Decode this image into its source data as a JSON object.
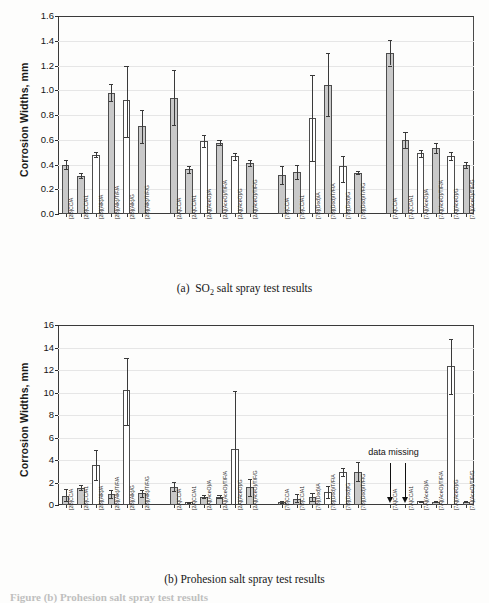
{
  "figure": {
    "caption_partial": "Figure  (b)  Prohesion salt spray test results",
    "ylabel": "Corrosion Widths, mm"
  },
  "panel_a": {
    "caption_prefix": "(a)",
    "caption_main_1": "SO",
    "caption_sub": "2",
    "caption_main_2": "salt spray test results"
  },
  "panel_b": {
    "caption": "(b) Prohesion salt spray test results",
    "annotation": "data missing"
  },
  "chart_data": [
    {
      "type": "bar",
      "title": "(a) SO2 salt spray test results",
      "xlabel": "",
      "ylabel": "Corrosion Widths, mm",
      "ylim": [
        0.0,
        1.6
      ],
      "yticks": [
        "0.0",
        "0.2",
        "0.4",
        "0.6",
        "0.8",
        "1.0",
        "1.2",
        "1.4",
        "1.6"
      ],
      "grid": false,
      "error_bars": true,
      "groups": [
        {
          "name": "2B",
          "categories": [
            "[2B]CC/A",
            "[2B]CC/A1",
            "[2B](Alk)/A",
            "[2B](Alk)/T/F/A",
            "[2B](Alk)/G",
            "[2B](Alk)/T/F/G"
          ],
          "values": [
            0.4,
            0.31,
            0.48,
            0.98,
            0.92,
            0.71
          ],
          "err_low": [
            0.035,
            0.02,
            0.02,
            0.07,
            0.3,
            0.14
          ],
          "err_high": [
            0.035,
            0.02,
            0.025,
            0.07,
            0.28,
            0.13
          ],
          "fill": [
            "gray",
            "gray",
            "white",
            "gray",
            "white",
            "gray"
          ]
        },
        {
          "name": "2A",
          "categories": [
            "[2A]CC/A",
            "[2A]CC/A1",
            "[2A](AceO)/A",
            "[2A](AceO)/T/F/A",
            "[2A](AceO)/G",
            "[2A](AceO)/T/F/G"
          ],
          "values": [
            0.94,
            0.36,
            0.59,
            0.575,
            0.465,
            0.415
          ],
          "err_low": [
            0.22,
            0.025,
            0.045,
            0.02,
            0.03,
            0.025
          ],
          "err_high": [
            0.22,
            0.025,
            0.045,
            0.02,
            0.03,
            0.025
          ],
          "fill": [
            "gray",
            "gray",
            "white",
            "gray",
            "white",
            "gray"
          ]
        },
        {
          "name": "7B",
          "categories": [
            "[7B]CC/A",
            "[7B]CC/A1",
            "[7B](Dod)/A",
            "[7B](Dod)/T/F/A",
            "[7B](Dod)/G",
            "[7B](Dod)/T/F/G"
          ],
          "values": [
            0.315,
            0.34,
            0.775,
            1.045,
            0.385,
            0.335
          ],
          "err_low": [
            0.075,
            0.055,
            0.345,
            0.255,
            0.125,
            0.015
          ],
          "err_high": [
            0.075,
            0.055,
            0.345,
            0.255,
            0.085,
            0.015
          ],
          "fill": [
            "gray",
            "gray",
            "white",
            "gray",
            "white",
            "gray"
          ]
        },
        {
          "name": "7A",
          "categories": [
            "[7A]CC/A",
            "[7A]CC/A1",
            "[7A](AceO)/A",
            "[7A](AceO)/T/F/A",
            "[7A](AceO)/G",
            "[7A](AceO)/T/F/G"
          ],
          "values": [
            1.305,
            0.6,
            0.49,
            0.535,
            0.47,
            0.395
          ],
          "err_low": [
            0.105,
            0.065,
            0.03,
            0.04,
            0.03,
            0.025
          ],
          "err_high": [
            0.105,
            0.065,
            0.03,
            0.04,
            0.03,
            0.025
          ],
          "fill": [
            "gray",
            "gray",
            "white",
            "gray",
            "white",
            "gray"
          ]
        }
      ]
    },
    {
      "type": "bar",
      "title": "(b) Prohesion salt spray test results",
      "xlabel": "",
      "ylabel": "Corrosion Widths, mm",
      "ylim": [
        0,
        16
      ],
      "yticks": [
        "0",
        "2",
        "4",
        "6",
        "8",
        "10",
        "12",
        "14",
        "16"
      ],
      "grid": false,
      "error_bars": true,
      "annotations": [
        {
          "text": "data missing",
          "targets": [
            "[7A]CC/A",
            "[7A]CC/A1"
          ]
        }
      ],
      "groups": [
        {
          "name": "2B",
          "categories": [
            "[2B]CC/A",
            "[2B]CC/A1",
            "[2B](Alk)/A",
            "[2B](Alk)/T/F/A",
            "[2B](Alk)/G",
            "[2B](Alk)/T/F/G"
          ],
          "values": [
            0.8,
            1.55,
            3.6,
            1.0,
            10.2,
            1.05
          ],
          "err_low": [
            0.45,
            0.2,
            1.35,
            0.35,
            3.05,
            0.35
          ],
          "err_high": [
            0.6,
            0.2,
            1.3,
            0.35,
            2.85,
            0.3
          ],
          "fill": [
            "gray",
            "gray",
            "white",
            "gray",
            "white",
            "gray"
          ]
        },
        {
          "name": "2A",
          "categories": [
            "[2A]CC/A",
            "[2A]CC/A1",
            "[2A](AceO)/A",
            "[2A](AceO)/T/F/A",
            "[2A](AceO)/G",
            "[2A](AceO)/T/F/G"
          ],
          "values": [
            1.6,
            0.25,
            0.75,
            0.7,
            5.0,
            1.6
          ],
          "err_low": [
            0.35,
            0.05,
            0.15,
            0.1,
            4.9,
            0.8
          ],
          "err_high": [
            0.45,
            0.05,
            0.15,
            0.15,
            5.1,
            0.75
          ],
          "fill": [
            "gray",
            "white",
            "gray",
            "gray",
            "white",
            "gray"
          ]
        },
        {
          "name": "7B",
          "categories": [
            "[7B]CC/A",
            "[7B]CC/A1",
            "[7B](Dod)/A",
            "[7B](Dod)/T/F/A",
            "[7B](Dod)/G",
            "[7B](Dod)/T/F/G"
          ],
          "values": [
            0.3,
            0.55,
            0.7,
            1.2,
            2.95,
            2.95
          ],
          "err_low": [
            0.1,
            0.3,
            0.35,
            0.55,
            0.35,
            0.85
          ],
          "err_high": [
            0.1,
            0.4,
            0.4,
            0.5,
            0.35,
            0.85
          ],
          "fill": [
            "gray",
            "gray",
            "gray",
            "white",
            "white",
            "gray"
          ]
        },
        {
          "name": "7A",
          "categories": [
            "[7A]CC/A",
            "[7A]CC/A1",
            "[7A](AceO)/A",
            "[7A](AceO)/T/F/A",
            "[7A](AceO)/G",
            "[7A](AceO)/T/F/G"
          ],
          "values": [
            0.0,
            0.0,
            0.35,
            0.3,
            12.35,
            0.3
          ],
          "err_low": [
            0,
            0,
            0.05,
            0.05,
            2.45,
            0.05
          ],
          "err_high": [
            0,
            0,
            0.05,
            0.05,
            2.45,
            0.05
          ],
          "fill": [
            "white",
            "white",
            "white",
            "gray",
            "white",
            "gray"
          ]
        }
      ]
    }
  ]
}
